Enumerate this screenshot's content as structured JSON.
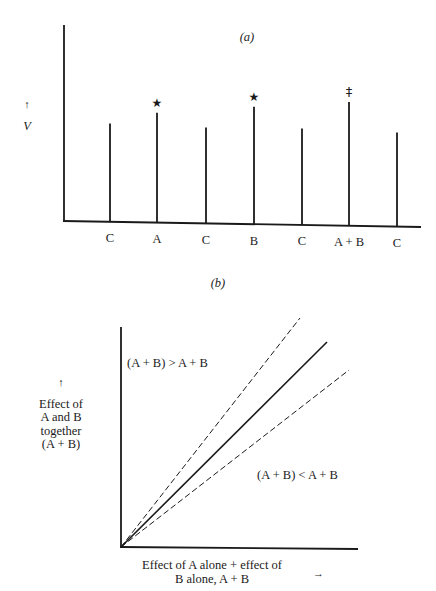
{
  "figure_a": {
    "panel_label": "(a)",
    "y_axis_label": "V",
    "y_axis_arrow": "↑"
  },
  "figure_b": {
    "panel_label": "(b)",
    "y_axis_arrow": "↑",
    "y_axis_label_lines": [
      "Effect of",
      "A and B",
      "together",
      "(A + B)"
    ],
    "x_axis_label_lines": [
      "Effect of A alone + effect of",
      "B alone, A + B"
    ],
    "x_axis_arrow": "→",
    "region_upper_label": "(A + B) > A + B",
    "region_lower_label": "(A + B) < A + B"
  },
  "chart_data": [
    {
      "type": "bar",
      "title": "(a)",
      "xlabel": "",
      "ylabel": "V",
      "categories": [
        "C",
        "A",
        "C",
        "B",
        "C",
        "A + B",
        "C"
      ],
      "values": [
        50,
        56,
        49,
        60,
        49,
        63,
        48
      ],
      "markers": [
        "",
        "★",
        "",
        "★",
        "",
        "‡",
        ""
      ],
      "ylim": [
        0,
        100
      ],
      "grid": false,
      "legend": null
    },
    {
      "type": "line",
      "title": "(b)",
      "xlabel": "Effect of A alone + effect of B alone, A + B",
      "ylabel": "Effect of A and B together (A + B)",
      "series": [
        {
          "name": "synergy (upper dashed)",
          "style": "dashed",
          "x": [
            0,
            1
          ],
          "y": [
            0,
            1.27
          ]
        },
        {
          "name": "additive (solid)",
          "style": "solid",
          "x": [
            0,
            1
          ],
          "y": [
            0,
            1.0
          ]
        },
        {
          "name": "antagonism (lower dashed)",
          "style": "dashed",
          "x": [
            0,
            1
          ],
          "y": [
            0,
            0.77
          ]
        }
      ],
      "annotations": [
        "(A + B) > A + B",
        "(A + B) < A + B"
      ],
      "grid": false,
      "legend": null
    }
  ]
}
